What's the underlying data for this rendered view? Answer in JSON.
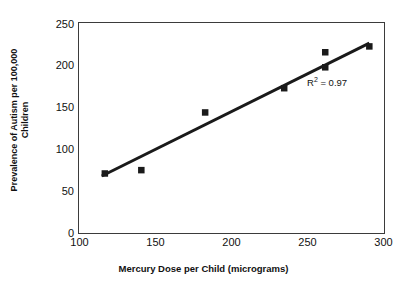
{
  "chart_data": {
    "type": "scatter",
    "title": "",
    "xlabel": "Mercury Dose per Child (micrograms)",
    "ylabel_line1": "Prevalence of Autism per 100,000",
    "ylabel_line2": "Children",
    "ylabel": "Prevalence of Autism per 100,000 Children",
    "xlim": [
      100,
      300
    ],
    "ylim": [
      0,
      250
    ],
    "xticks": [
      100,
      150,
      200,
      250,
      300
    ],
    "yticks": [
      0,
      50,
      100,
      150,
      200,
      250
    ],
    "xtick_labels": [
      "100",
      "150",
      "200",
      "250",
      "300"
    ],
    "ytick_labels": [
      "0",
      "50",
      "100",
      "150",
      "200",
      "250"
    ],
    "grid": false,
    "legend": false,
    "marker": "square",
    "marker_color": "#1a1a1a",
    "line_color": "#1a1a1a",
    "points": [
      {
        "x": 117,
        "y": 70
      },
      {
        "x": 141,
        "y": 74
      },
      {
        "x": 183,
        "y": 143
      },
      {
        "x": 235,
        "y": 172
      },
      {
        "x": 262,
        "y": 215
      },
      {
        "x": 262,
        "y": 197
      },
      {
        "x": 291,
        "y": 222
      }
    ],
    "trendline": {
      "x_start": 115,
      "y_start": 67,
      "x_end": 291,
      "y_end": 226
    },
    "annotations": [
      {
        "name": "r-squared",
        "text_prefix": "R",
        "text_sup": "2",
        "text_suffix": " = 0.97",
        "value": 0.97
      }
    ]
  }
}
